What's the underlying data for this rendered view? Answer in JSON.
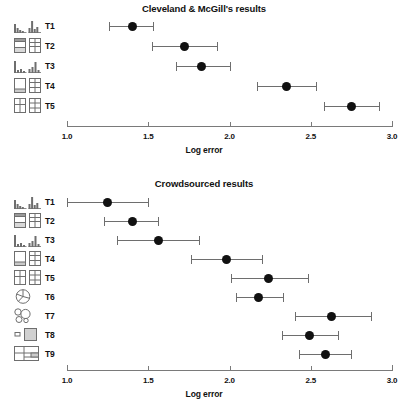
{
  "figure": {
    "axis_label": "Log error",
    "tick_labels": [
      "1.0",
      "1.5",
      "2.0",
      "2.5",
      "3.0"
    ]
  },
  "panels": [
    {
      "id": "top",
      "title": "Cleveland & McGill's results"
    },
    {
      "id": "bottom",
      "title": "Crowdsourced results"
    }
  ],
  "chart_data": [
    {
      "type": "scatter",
      "title": "Cleveland & McGill's results",
      "xlabel": "Log error",
      "ylabel": "",
      "xlim": [
        1.0,
        3.0
      ],
      "xticks": [
        1.0,
        1.5,
        2.0,
        2.5,
        3.0
      ],
      "xticklabels": [
        "1.0",
        "1.5",
        "2.0",
        "2.5",
        "3.0"
      ],
      "grid": false,
      "legend": "none",
      "orientation": "horizontal",
      "error_bars": "horizontal",
      "categories": [
        "T1",
        "T2",
        "T3",
        "T4",
        "T5"
      ],
      "category_icons": [
        "bar-chart-grouped-icon",
        "stacked-bar-two-panel-icon",
        "bar-chart-separated-icon",
        "stacked-bar-tall-icon",
        "stacked-bar-split-icon"
      ],
      "series": [
        {
          "name": "Log error",
          "values": [
            1.4,
            1.72,
            1.83,
            2.35,
            2.75
          ],
          "ci_low": [
            1.26,
            1.52,
            1.67,
            2.17,
            2.58
          ],
          "ci_high": [
            1.53,
            1.92,
            2.0,
            2.53,
            2.92
          ]
        }
      ]
    },
    {
      "type": "scatter",
      "title": "Crowdsourced results",
      "xlabel": "Log error",
      "ylabel": "",
      "xlim": [
        1.0,
        3.0
      ],
      "xticks": [
        1.0,
        1.5,
        2.0,
        2.5,
        3.0
      ],
      "xticklabels": [
        "1.0",
        "1.5",
        "2.0",
        "2.5",
        "3.0"
      ],
      "grid": false,
      "legend": "none",
      "orientation": "horizontal",
      "error_bars": "horizontal",
      "categories": [
        "T1",
        "T2",
        "T3",
        "T4",
        "T5",
        "T6",
        "T7",
        "T8",
        "T9"
      ],
      "category_icons": [
        "bar-chart-grouped-icon",
        "stacked-bar-two-panel-icon",
        "bar-chart-separated-icon",
        "stacked-bar-tall-icon",
        "stacked-bar-split-icon",
        "pie-chart-icon",
        "bubble-chart-icon",
        "area-square-pair-icon",
        "treemap-icon"
      ],
      "series": [
        {
          "name": "Log error",
          "values": [
            1.25,
            1.4,
            1.56,
            1.98,
            2.24,
            2.18,
            2.63,
            2.49,
            2.59
          ],
          "ci_low": [
            1.0,
            1.23,
            1.31,
            1.76,
            2.01,
            2.04,
            2.4,
            2.32,
            2.43
          ],
          "ci_high": [
            1.5,
            1.56,
            1.81,
            2.2,
            2.48,
            2.33,
            2.87,
            2.67,
            2.75
          ]
        }
      ]
    }
  ],
  "colors": {
    "dot": "#111111",
    "errorbar": "#6e6e6e",
    "axis": "#7a7a7a",
    "text": "#111111",
    "background": "#ffffff"
  }
}
